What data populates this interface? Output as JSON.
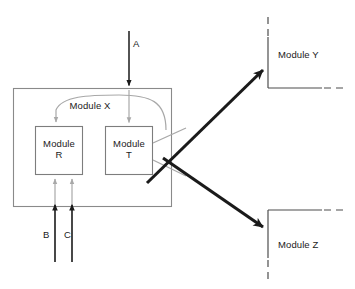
{
  "diagram": {
    "colors": {
      "outer_box_stroke": "#8a8a8a",
      "inner_box_stroke": "#7d7d7d",
      "gray_arrow": "#a8a8a8",
      "black_arrow": "#1a1a1a",
      "thick_arrow": "#1a1a1a",
      "module_yz_stroke": "#4d4d4d",
      "text": "#1a1a1a",
      "background": "#ffffff"
    },
    "container": {
      "name": "Module X",
      "label": "Module X",
      "label_x": 90,
      "label_y": 100,
      "box": {
        "x": 13,
        "y": 88,
        "width": 159,
        "height": 119
      }
    },
    "inner_modules": [
      {
        "id": "module-r",
        "line1": "Module",
        "line2": "R",
        "box": {
          "x": 35,
          "y": 126,
          "width": 48,
          "height": 49
        },
        "label_x": 59,
        "label_y": 140
      },
      {
        "id": "module-t",
        "line1": "Module",
        "line2": "T",
        "box": {
          "x": 105,
          "y": 126,
          "width": 48,
          "height": 49
        },
        "label_x": 129,
        "label_y": 140
      }
    ],
    "external_modules": [
      {
        "id": "module-y",
        "label": "Module Y",
        "label_x": 278,
        "label_y": 54,
        "corner_x": 268,
        "corner_y": 88
      },
      {
        "id": "module-z",
        "label": "Module Z",
        "label_x": 278,
        "label_y": 244,
        "corner_x": 268,
        "corner_y": 210
      }
    ],
    "input_signals": [
      {
        "id": "signal-a",
        "label": "A",
        "label_x": 136,
        "label_y": 42,
        "arrow_x": 129,
        "from_y": 47,
        "to_y": 88
      },
      {
        "id": "signal-b",
        "label": "B",
        "label_x": 45,
        "label_y": 232,
        "arrow_x": 55,
        "from_y": 262,
        "to_y": 207
      },
      {
        "id": "signal-c",
        "label": "C",
        "label_x": 65,
        "label_y": 232,
        "arrow_x": 72,
        "from_y": 262,
        "to_y": 207
      }
    ],
    "connections": [
      {
        "id": "a-to-t",
        "style": "gray",
        "description": "A continues into Module T"
      },
      {
        "id": "b-to-r",
        "style": "gray",
        "description": "B continues into Module R"
      },
      {
        "id": "c-to-r",
        "style": "gray",
        "description": "C continues into Module R"
      },
      {
        "id": "t-feedback-to-r",
        "style": "gray-curve",
        "description": "Module T output curves back to Module R"
      },
      {
        "id": "t-to-module-y",
        "style": "thick-black",
        "description": "Module T output to Module Y"
      },
      {
        "id": "t-to-module-z",
        "style": "thick-black",
        "description": "Module T output to Module Z"
      }
    ]
  }
}
